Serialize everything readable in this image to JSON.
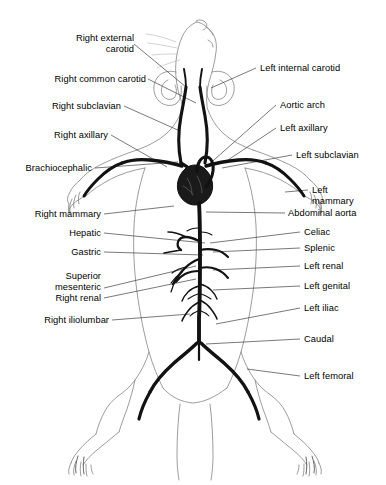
{
  "figure": {
    "colors": {
      "artery": "#111111",
      "outline": "#6f6f6f",
      "leader": "#4a4a4a",
      "background": "#ffffff",
      "text": "#000000"
    }
  },
  "labels_left": [
    {
      "id": "right-external-carotid",
      "line1": "Right external",
      "line2": "carotid",
      "x": 60,
      "y": 33,
      "anchor_x": 134,
      "anchor_y": 44,
      "target_x": 186,
      "target_y": 87
    },
    {
      "id": "right-common-carotid",
      "line1": "Right common carotid",
      "line2": "",
      "x": 22,
      "y": 74,
      "anchor_x": 148,
      "anchor_y": 79,
      "target_x": 196,
      "target_y": 103
    },
    {
      "id": "right-subclavian",
      "line1": "Right subclavian",
      "line2": "",
      "x": 31,
      "y": 101,
      "anchor_x": 124,
      "anchor_y": 106,
      "target_x": 180,
      "target_y": 131
    },
    {
      "id": "right-axillary",
      "line1": "Right axillary",
      "line2": "",
      "x": 34,
      "y": 130,
      "anchor_x": 111,
      "anchor_y": 135,
      "target_x": 167,
      "target_y": 167
    },
    {
      "id": "brachiocephalic",
      "line1": "Brachiocephalic",
      "line2": "",
      "x": 18,
      "y": 163,
      "anchor_x": 95,
      "anchor_y": 168,
      "target_x": 178,
      "target_y": 162
    },
    {
      "id": "right-mammary",
      "line1": "Right mammary",
      "line2": "",
      "x": 26,
      "y": 209,
      "anchor_x": 104,
      "anchor_y": 214,
      "target_x": 174,
      "target_y": 206
    },
    {
      "id": "hepatic",
      "line1": "Hepatic",
      "line2": "",
      "x": 62,
      "y": 228,
      "anchor_x": 104,
      "anchor_y": 233,
      "target_x": 205,
      "target_y": 243
    },
    {
      "id": "gastric",
      "line1": "Gastric",
      "line2": "",
      "x": 64,
      "y": 247,
      "anchor_x": 104,
      "anchor_y": 252,
      "target_x": 203,
      "target_y": 254
    },
    {
      "id": "superior-mesenteric",
      "line1": "Superior",
      "line2": "mesenteric",
      "x": 33,
      "y": 271,
      "anchor_x": 104,
      "anchor_y": 288,
      "target_x": 196,
      "target_y": 266
    },
    {
      "id": "right-renal",
      "line1": "Right renal",
      "line2": "",
      "x": 43,
      "y": 293,
      "anchor_x": 104,
      "anchor_y": 298,
      "target_x": 196,
      "target_y": 278
    },
    {
      "id": "right-iliolumbar",
      "line1": "Right iliolumbar",
      "line2": "",
      "x": 26,
      "y": 315,
      "anchor_x": 112,
      "anchor_y": 320,
      "target_x": 190,
      "target_y": 314
    }
  ],
  "labels_right": [
    {
      "id": "left-internal-carotid",
      "line1": "Left internal carotid",
      "line2": "",
      "x": 260,
      "y": 63,
      "anchor_x": 256,
      "anchor_y": 68,
      "target_x": 211,
      "target_y": 88
    },
    {
      "id": "aortic-arch",
      "line1": "Aortic arch",
      "line2": "",
      "x": 280,
      "y": 100,
      "anchor_x": 276,
      "anchor_y": 105,
      "target_x": 206,
      "target_y": 167
    },
    {
      "id": "left-axillary",
      "line1": "Left axillary",
      "line2": "",
      "x": 280,
      "y": 123,
      "anchor_x": 276,
      "anchor_y": 128,
      "target_x": 228,
      "target_y": 160
    },
    {
      "id": "left-subclavian",
      "line1": "Left subclavian",
      "line2": "",
      "x": 296,
      "y": 150,
      "anchor_x": 292,
      "anchor_y": 155,
      "target_x": 222,
      "target_y": 168
    },
    {
      "id": "left-mammary",
      "line1": "Left",
      "line2": "mammary",
      "x": 312,
      "y": 185,
      "anchor_x": 308,
      "anchor_y": 190,
      "target_x": 285,
      "target_y": 192
    },
    {
      "id": "abdominal-aorta",
      "line1": "Abdominal aorta",
      "line2": "",
      "x": 288,
      "y": 208,
      "anchor_x": 285,
      "anchor_y": 213,
      "target_x": 206,
      "target_y": 212
    },
    {
      "id": "celiac",
      "line1": "Celiac",
      "line2": "",
      "x": 304,
      "y": 227,
      "anchor_x": 300,
      "anchor_y": 232,
      "target_x": 210,
      "target_y": 243
    },
    {
      "id": "splenic",
      "line1": "Splenic",
      "line2": "",
      "x": 304,
      "y": 243,
      "anchor_x": 300,
      "anchor_y": 248,
      "target_x": 213,
      "target_y": 252
    },
    {
      "id": "left-renal",
      "line1": "Left renal",
      "line2": "",
      "x": 304,
      "y": 261,
      "anchor_x": 300,
      "anchor_y": 266,
      "target_x": 213,
      "target_y": 270
    },
    {
      "id": "left-genital",
      "line1": "Left genital",
      "line2": "",
      "x": 304,
      "y": 281,
      "anchor_x": 300,
      "anchor_y": 286,
      "target_x": 213,
      "target_y": 290
    },
    {
      "id": "left-iliac",
      "line1": "Left iliac",
      "line2": "",
      "x": 304,
      "y": 303,
      "anchor_x": 300,
      "anchor_y": 308,
      "target_x": 216,
      "target_y": 324
    },
    {
      "id": "caudal",
      "line1": "Caudal",
      "line2": "",
      "x": 304,
      "y": 334,
      "anchor_x": 300,
      "anchor_y": 339,
      "target_x": 206,
      "target_y": 344
    },
    {
      "id": "left-femoral",
      "line1": "Left femoral",
      "line2": "",
      "x": 304,
      "y": 371,
      "anchor_x": 300,
      "anchor_y": 376,
      "target_x": 247,
      "target_y": 369
    }
  ],
  "anatomy": {
    "structures": [
      "heart",
      "aortic-arch",
      "abdominal-aorta",
      "common-carotid-left",
      "common-carotid-right",
      "subclavian-left",
      "subclavian-right",
      "axillary-left",
      "axillary-right",
      "iliac-left",
      "iliac-right",
      "femoral-left",
      "femoral-right",
      "caudal-artery",
      "renal-arteries",
      "mesenteric-arteries",
      "body-outline",
      "head-outline",
      "forelimbs",
      "hindlimbs"
    ]
  }
}
